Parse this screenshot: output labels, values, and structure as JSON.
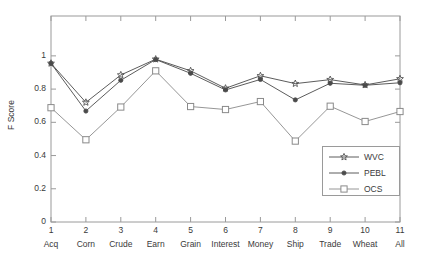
{
  "chart_data": {
    "type": "line",
    "title": "",
    "xlabel": "",
    "ylabel": "F Score",
    "ylim": [
      0,
      1.24
    ],
    "yticks": [
      "0",
      "0.2",
      "0.4",
      "0.6",
      "0.8",
      "1"
    ],
    "ytick_values": [
      0,
      0.2,
      0.4,
      0.6,
      0.8,
      1
    ],
    "grid": false,
    "legend_position": "lower right",
    "x": [
      1,
      2,
      3,
      4,
      5,
      6,
      7,
      8,
      9,
      10,
      11
    ],
    "xtick_numbers": [
      "1",
      "2",
      "3",
      "4",
      "5",
      "6",
      "7",
      "8",
      "9",
      "10",
      "11"
    ],
    "categories": [
      "Acq",
      "Corn",
      "Crude",
      "Earn",
      "Grain",
      "Interest",
      "Money",
      "Ship",
      "Trade",
      "Wheat",
      "All"
    ],
    "series": [
      {
        "name": "WVC",
        "marker": "pentagram-star-open",
        "color": "#4a4a4a",
        "values": [
          0.955,
          0.72,
          0.885,
          0.98,
          0.91,
          0.805,
          0.88,
          0.833,
          0.857,
          0.825,
          0.862
        ]
      },
      {
        "name": "PEBL",
        "marker": "filled-circle",
        "color": "#4a4a4a",
        "values": [
          0.955,
          0.668,
          0.853,
          0.978,
          0.895,
          0.795,
          0.858,
          0.735,
          0.835,
          0.823,
          0.838
        ]
      },
      {
        "name": "OCS",
        "marker": "open-square",
        "color": "#8a8a8a",
        "values": [
          0.688,
          0.495,
          0.692,
          0.91,
          0.695,
          0.677,
          0.725,
          0.487,
          0.697,
          0.605,
          0.665
        ]
      }
    ]
  },
  "legend": {
    "entries": [
      {
        "label": "WVC"
      },
      {
        "label": "PEBL"
      },
      {
        "label": "OCS"
      }
    ]
  },
  "axis": {
    "y_title": "F Score"
  }
}
